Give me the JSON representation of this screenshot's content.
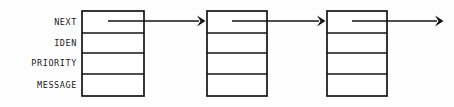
{
  "diagram": {
    "type": "linked-list",
    "background_color": "#fefefe",
    "line_color": "#141414",
    "text_color": "#1a1a1a",
    "field_labels": [
      {
        "id": "next",
        "text": "NEXT"
      },
      {
        "id": "iden",
        "text": "IDEN"
      },
      {
        "id": "priority",
        "text": "PRIORITY"
      },
      {
        "id": "message",
        "text": "MESSAGE"
      }
    ],
    "label_column": {
      "right_edge_x": 77,
      "rows_y": [
        22,
        43,
        63,
        85
      ]
    },
    "nodes": [
      {
        "id": "node-1",
        "x": 82,
        "y": 11,
        "width": 62,
        "height": 85,
        "cells": 4
      },
      {
        "id": "node-2",
        "x": 207,
        "y": 11,
        "width": 60,
        "height": 85,
        "cells": 4
      },
      {
        "id": "node-3",
        "x": 327,
        "y": 11,
        "width": 60,
        "height": 85,
        "cells": 4
      }
    ],
    "row_boundaries_y": [
      11,
      33,
      53,
      74,
      96
    ],
    "links": [
      {
        "id": "link-1",
        "from": "node-1",
        "to": "node-2",
        "x1": 108,
        "x2": 205,
        "y": 21,
        "has_arrowhead": true
      },
      {
        "id": "link-2",
        "from": "node-2",
        "to": "node-3",
        "x1": 232,
        "x2": 325,
        "y": 21,
        "has_arrowhead": true
      },
      {
        "id": "link-3",
        "from": "node-3",
        "to": "null",
        "x1": 352,
        "x2": 443,
        "y": 21,
        "has_arrowhead": true
      }
    ]
  }
}
